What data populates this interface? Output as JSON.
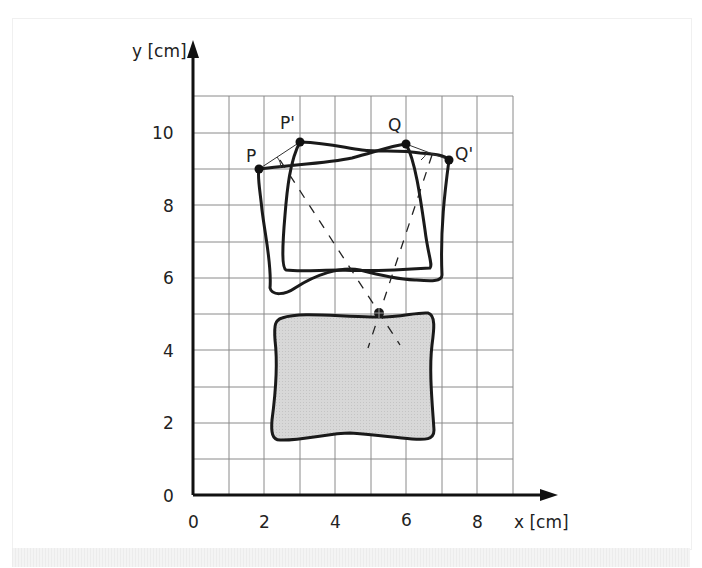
{
  "figure": {
    "x_axis_label": "x [cm]",
    "y_axis_label": "y [cm]",
    "x_ticks": [
      "0",
      "2",
      "4",
      "6",
      "8"
    ],
    "y_ticks": [
      "0",
      "2",
      "4",
      "6",
      "8",
      "10"
    ],
    "points": {
      "P": "P",
      "P_prime": "P'",
      "Q": "Q",
      "Q_prime": "Q'"
    },
    "colors": {
      "grid": "#8a8a8a",
      "axis": "#111111",
      "shape_fill": "#d6d6d6",
      "stroke": "#1a1a1a"
    }
  }
}
